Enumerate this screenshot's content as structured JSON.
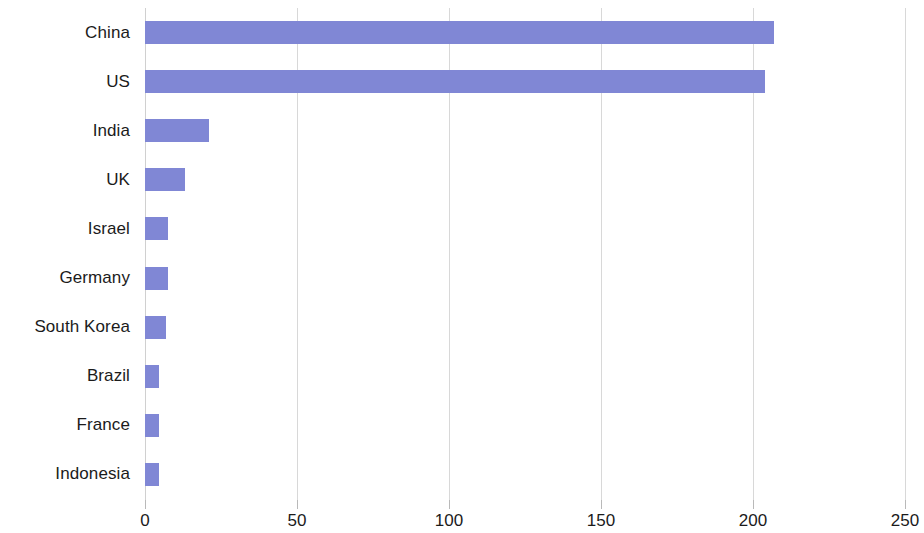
{
  "chart_data": {
    "type": "bar",
    "orientation": "horizontal",
    "title": "",
    "subtitle": "",
    "xlabel": "",
    "ylabel": "",
    "categories": [
      "China",
      "US",
      "India",
      "UK",
      "Israel",
      "Germany",
      "South Korea",
      "Brazil",
      "France",
      "Indonesia"
    ],
    "values": [
      207,
      204,
      21,
      13,
      7.5,
      7.5,
      7,
      4.5,
      4.5,
      4.5
    ],
    "series": [
      {
        "name": "",
        "values": [
          207,
          204,
          21,
          13,
          7.5,
          7.5,
          7,
          4.5,
          4.5,
          4.5
        ],
        "color": "#8087d5"
      }
    ],
    "xlim": [
      0,
      250
    ],
    "xticks": [
      0,
      50,
      100,
      150,
      200,
      250
    ],
    "xtick_labels": [
      "0",
      "50",
      "100",
      "150",
      "200",
      "250"
    ],
    "grid": "vertical",
    "gridline_color": "#d8d8d8",
    "legend": null,
    "legend_position": "none",
    "annotations": [],
    "bar_color": "#8087d5",
    "background_color": "#ffffff",
    "text_color": "#1b1b1b"
  }
}
